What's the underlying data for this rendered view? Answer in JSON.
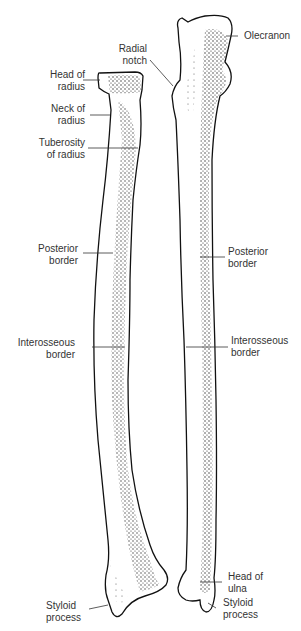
{
  "figure": {
    "bones": [
      "Radius",
      "Ulna"
    ],
    "colors": {
      "outline": "#111111",
      "stipple": "#222222",
      "background": "#ffffff",
      "text": "#333333"
    }
  },
  "labels": {
    "radial_notch": [
      "Radial",
      "notch"
    ],
    "olecranon": [
      "Olecranon"
    ],
    "head_of_radius": [
      "Head of",
      "radius"
    ],
    "neck_of_radius": [
      "Neck of",
      "radius"
    ],
    "tuberosity_of_radius": [
      "Tuberosity",
      "of radius"
    ],
    "posterior_border_radius": [
      "Posterior",
      "border"
    ],
    "posterior_border_ulna": [
      "Posterior",
      "border"
    ],
    "interosseous_border_radius": [
      "Interosseous",
      "border"
    ],
    "interosseous_border_ulna": [
      "Interosseous",
      "border"
    ],
    "styloid_process_radius": [
      "Styloid",
      "process"
    ],
    "head_of_ulna": [
      "Head of",
      "ulna"
    ],
    "styloid_process_ulna": [
      "Styloid",
      "process"
    ]
  }
}
